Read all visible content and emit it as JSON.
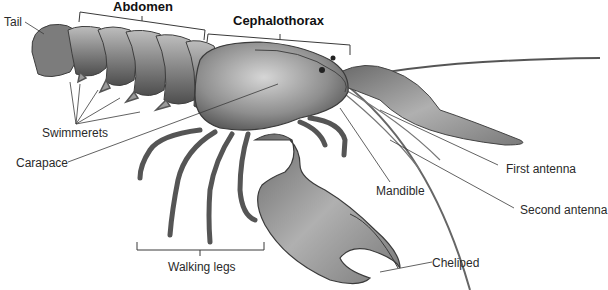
{
  "diagram": {
    "labels": {
      "abdomen": "Abdomen",
      "cephalothorax": "Cephalothorax",
      "tail": "Tail",
      "swimmerets": "Swimmerets",
      "carapace": "Carapace",
      "mandible": "Mandible",
      "first_antenna": "First antenna",
      "second_antenna": "Second antenna",
      "walking_legs": "Walking legs",
      "cheliped": "Cheliped"
    },
    "colors": {
      "background": "#ffffff",
      "label_text": "#2a2a2a",
      "leader_line": "#3a3a3a",
      "body_dark": "#5a5a5a",
      "body_mid": "#8c8c8c",
      "body_light": "#c4c4c4"
    }
  }
}
